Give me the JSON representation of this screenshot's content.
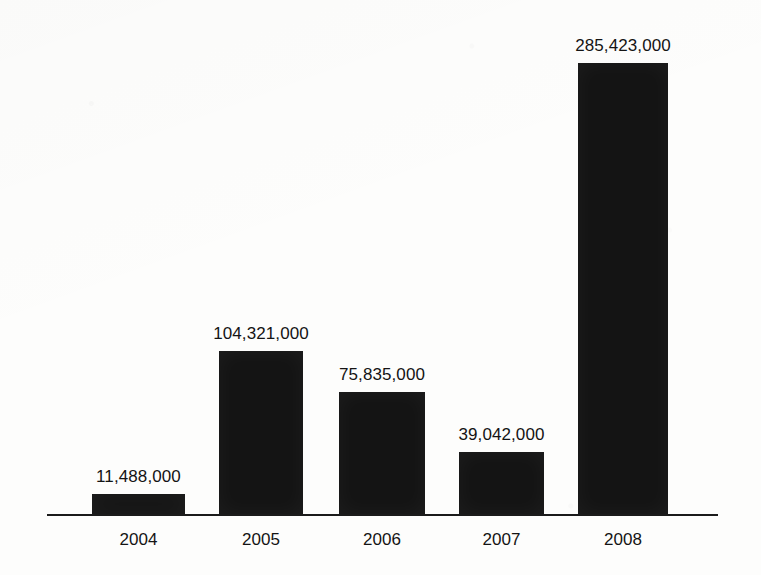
{
  "chart_data": {
    "type": "bar",
    "title": "",
    "subtitle": "",
    "xlabel": "",
    "ylabel": "",
    "categories": [
      "2004",
      "2005",
      "2006",
      "2007",
      "2008"
    ],
    "values": [
      11488000,
      104321000,
      75835000,
      39042000,
      285423000
    ],
    "value_labels": [
      "11,488,000",
      "104,321,000",
      "75,835,000",
      "39,042,000",
      "285,423,000"
    ],
    "series": [
      {
        "name": "",
        "values": [
          11488000,
          104321000,
          75835000,
          39042000,
          285423000
        ]
      }
    ],
    "ylim": [
      0,
      285423000
    ],
    "grid": false,
    "legend": false,
    "legend_position": "none",
    "annotations": [],
    "bar_color": "#141414",
    "axis_color": "#1b1b1b",
    "background_color": "#fdfdfc",
    "label_color": "#141414"
  },
  "layout": {
    "baseline_y": 514,
    "axis_left": 47,
    "axis_right": 718,
    "bars": [
      {
        "left": 92,
        "width": 93,
        "top": 494
      },
      {
        "left": 219,
        "width": 84,
        "top": 351
      },
      {
        "left": 339,
        "width": 86,
        "top": 392
      },
      {
        "left": 459,
        "width": 85,
        "top": 452
      },
      {
        "left": 578,
        "width": 90,
        "top": 63
      }
    ],
    "value_label_y": [
      467,
      324,
      365,
      425,
      36
    ],
    "category_label_y": 530
  }
}
